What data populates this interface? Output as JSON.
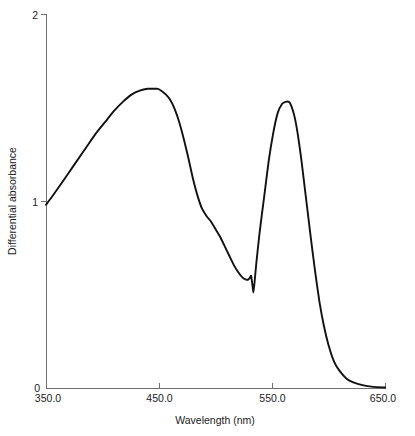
{
  "chart_data": {
    "type": "line",
    "title": "",
    "subtitle": "",
    "xlabel": "Wavelength (nm)",
    "ylabel": "Differential absorbance",
    "xlim": [
      350.0,
      650.0
    ],
    "ylim": [
      0,
      2
    ],
    "grid": false,
    "legend": null,
    "x_ticks": [
      {
        "value": 350.0,
        "label": "350.0"
      },
      {
        "value": 450.0,
        "label": "450.0"
      },
      {
        "value": 550.0,
        "label": "550.0"
      },
      {
        "value": 650.0,
        "label": "650.0"
      }
    ],
    "y_ticks": [
      {
        "value": 0,
        "label": "0"
      },
      {
        "value": 1,
        "label": "1"
      },
      {
        "value": 2,
        "label": "2"
      }
    ],
    "series": [
      {
        "name": "Differential absorbance spectrum",
        "color": "#111111",
        "x": [
          350.0,
          355.0,
          362.0,
          370.0,
          378.0,
          386.0,
          394.0,
          402.0,
          410.0,
          418.0,
          426.0,
          433.0,
          440.0,
          445.0,
          449.0,
          452.0,
          456.0,
          460.0,
          464.0,
          468.0,
          472.0,
          476.0,
          480.0,
          484.0,
          488.0,
          492.0,
          496.0,
          500.0,
          504.0,
          508.0,
          512.0,
          516.0,
          520.0,
          524.0,
          527.0,
          529.0,
          530.5,
          531.5,
          532.5,
          533.5,
          534.5,
          536.0,
          539.0,
          543.0,
          547.0,
          551.0,
          555.0,
          559.0,
          562.0,
          565.0,
          567.0,
          570.0,
          573.0,
          576.0,
          580.0,
          584.0,
          588.0,
          592.0,
          596.0,
          600.0,
          605.0,
          610.0,
          616.0,
          622.0,
          630.0,
          640.0,
          650.0
        ],
        "y": [
          0.98,
          1.02,
          1.08,
          1.15,
          1.22,
          1.29,
          1.36,
          1.42,
          1.48,
          1.53,
          1.57,
          1.59,
          1.6,
          1.6,
          1.6,
          1.59,
          1.57,
          1.54,
          1.49,
          1.42,
          1.33,
          1.23,
          1.12,
          1.03,
          0.96,
          0.92,
          0.89,
          0.85,
          0.81,
          0.76,
          0.71,
          0.66,
          0.62,
          0.59,
          0.58,
          0.58,
          0.59,
          0.6,
          0.56,
          0.51,
          0.56,
          0.66,
          0.83,
          1.02,
          1.21,
          1.36,
          1.47,
          1.52,
          1.53,
          1.53,
          1.51,
          1.45,
          1.35,
          1.22,
          1.02,
          0.82,
          0.63,
          0.46,
          0.33,
          0.23,
          0.14,
          0.09,
          0.05,
          0.03,
          0.015,
          0.006,
          0.003
        ],
        "features": {
          "peak_1_nm": 451.0,
          "peak_1_value": 1.6,
          "shoulder_nm": 489.0,
          "shoulder_value": 0.95,
          "trough_nm": 530.0,
          "trough_value": 0.58,
          "notch_nm": 533.5,
          "notch_value": 0.51,
          "peak_2_nm": 566.0,
          "peak_2_value": 1.53
        }
      }
    ],
    "annotations": []
  },
  "layout": {
    "plot_left_px": 46,
    "plot_right_px": 385,
    "plot_top_px": 14,
    "plot_bottom_px": 388
  }
}
